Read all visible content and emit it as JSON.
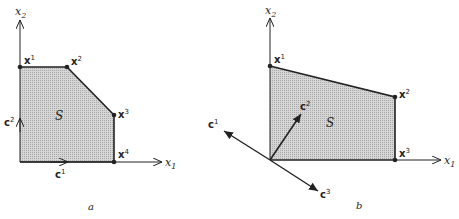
{
  "figure": {
    "colors": {
      "region_fill": "#c8c8c8",
      "stroke": "#222222",
      "background": "#ffffff"
    },
    "panels": [
      {
        "id": "a",
        "caption": "a",
        "axes": {
          "x_label": "x",
          "x_sub": "1",
          "y_label": "x",
          "y_sub": "2"
        },
        "region_label": "S",
        "vertices": [
          {
            "name": "x",
            "sup": "1"
          },
          {
            "name": "x",
            "sup": "2"
          },
          {
            "name": "x",
            "sup": "3"
          },
          {
            "name": "x",
            "sup": "4"
          }
        ],
        "vectors": [
          {
            "name": "c",
            "sup": "1",
            "direction": "right"
          },
          {
            "name": "c",
            "sup": "2",
            "direction": "up"
          }
        ]
      },
      {
        "id": "b",
        "caption": "b",
        "axes": {
          "x_label": "x",
          "x_sub": "1",
          "y_label": "x",
          "y_sub": "2"
        },
        "region_label": "S",
        "vertices": [
          {
            "name": "x",
            "sup": "1"
          },
          {
            "name": "x",
            "sup": "2"
          },
          {
            "name": "x",
            "sup": "3"
          }
        ],
        "vectors": [
          {
            "name": "c",
            "sup": "1",
            "direction": "upper-left"
          },
          {
            "name": "c",
            "sup": "2",
            "direction": "upper-right"
          },
          {
            "name": "c",
            "sup": "3",
            "direction": "lower-right"
          }
        ]
      }
    ]
  }
}
